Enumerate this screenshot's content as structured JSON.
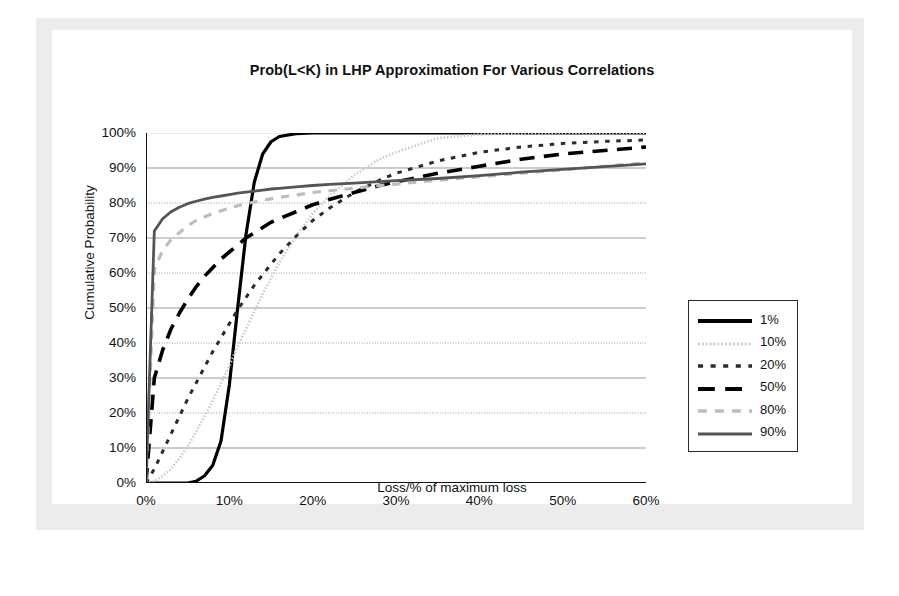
{
  "chart_data": {
    "type": "line",
    "title": "Prob(L<K) in LHP Approximation For Various Correlations",
    "xlabel": "Loss/% of maximum loss",
    "ylabel": "Cumulative Probability",
    "xlim": [
      0,
      60
    ],
    "ylim": [
      0,
      100
    ],
    "grid": true,
    "legend_position": "right-inside",
    "xticks": [
      "0%",
      "10%",
      "20%",
      "30%",
      "40%",
      "50%",
      "60%"
    ],
    "yticks": [
      "0%",
      "10%",
      "20%",
      "30%",
      "40%",
      "50%",
      "60%",
      "70%",
      "80%",
      "90%",
      "100%"
    ],
    "x": [
      0,
      1,
      2,
      3,
      4,
      5,
      6,
      7,
      8,
      9,
      10,
      11,
      12,
      13,
      14,
      15,
      16,
      18,
      20,
      22,
      25,
      28,
      30,
      35,
      40,
      45,
      50,
      55,
      60
    ],
    "series": [
      {
        "name": "1%",
        "color": "#000000",
        "style": "solid",
        "width": 3.2,
        "values": [
          0,
          0,
          0,
          0,
          0,
          0,
          0.5,
          2,
          5,
          12,
          28,
          50,
          71,
          86,
          94,
          97.5,
          99,
          99.8,
          100,
          100,
          100,
          100,
          100,
          100,
          100,
          100,
          100,
          100,
          100
        ]
      },
      {
        "name": "10%",
        "color": "#c9c9c9",
        "style": "dotted-fine",
        "width": 2.6,
        "values": [
          0,
          0.5,
          2,
          4,
          7,
          10.5,
          14.5,
          19,
          23.5,
          28.5,
          33.5,
          39,
          44,
          49,
          54,
          58.5,
          63,
          70.5,
          77,
          82,
          88,
          92.5,
          94.5,
          98.5,
          99.6,
          99.9,
          100,
          100,
          100
        ]
      },
      {
        "name": "20%",
        "color": "#2b2b2b",
        "style": "dotted",
        "width": 3.0,
        "values": [
          0,
          4,
          9,
          14,
          19,
          24,
          28.5,
          33,
          37.5,
          41.5,
          45.5,
          49.5,
          53,
          56.5,
          59.5,
          62.5,
          65.5,
          70.5,
          75,
          78.5,
          83,
          86.5,
          88.5,
          92,
          94.5,
          96,
          97,
          97.6,
          98
        ]
      },
      {
        "name": "50%",
        "color": "#000000",
        "style": "dashed-long",
        "width": 3.6,
        "values": [
          0,
          30,
          38,
          44,
          48.5,
          52.5,
          56,
          59,
          61.5,
          64,
          66,
          68,
          70,
          71.5,
          73,
          74.5,
          75.5,
          77.5,
          79.5,
          81,
          83,
          85,
          86,
          88.5,
          90.5,
          92.5,
          94,
          95,
          96
        ]
      },
      {
        "name": "80%",
        "color": "#bdbdbd",
        "style": "dashed",
        "width": 3.2,
        "values": [
          0,
          61,
          66.5,
          69.5,
          71.5,
          73.5,
          75,
          76,
          77,
          77.8,
          78.5,
          79.2,
          79.8,
          80.3,
          80.8,
          81.2,
          81.6,
          82.3,
          83,
          83.5,
          84.2,
          85,
          85.4,
          86.5,
          87.5,
          88.5,
          89.5,
          90.5,
          91.5
        ]
      },
      {
        "name": "90%",
        "color": "#555555",
        "style": "solid",
        "width": 2.8,
        "values": [
          0,
          72,
          75.5,
          77.5,
          78.8,
          79.8,
          80.5,
          81.1,
          81.6,
          82,
          82.4,
          82.8,
          83.1,
          83.4,
          83.7,
          84,
          84.2,
          84.6,
          85,
          85.3,
          85.7,
          86.1,
          86.4,
          87,
          87.8,
          88.8,
          89.6,
          90.4,
          91.2
        ]
      }
    ],
    "legend": [
      {
        "label": "1%",
        "color": "#000000",
        "style": "solid",
        "width": 4
      },
      {
        "label": "10%",
        "color": "#c9c9c9",
        "style": "dotted-fine",
        "width": 3
      },
      {
        "label": "20%",
        "color": "#2b2b2b",
        "style": "dotted",
        "width": 3.4
      },
      {
        "label": "50%",
        "color": "#000000",
        "style": "dashed-long",
        "width": 4
      },
      {
        "label": "80%",
        "color": "#bdbdbd",
        "style": "dashed",
        "width": 3.4
      },
      {
        "label": "90%",
        "color": "#555555",
        "style": "solid",
        "width": 3.2
      }
    ],
    "axis_color": "#111111",
    "grid_color": "#8f8f8f"
  }
}
